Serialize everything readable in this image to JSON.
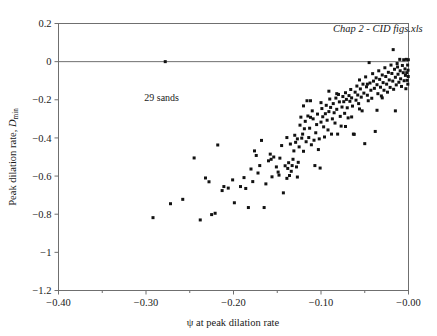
{
  "chart_data": {
    "type": "scatter",
    "title": "",
    "xlabel": "ψ at peak dilation rate",
    "ylabel": "Peak dilation rate, D_min",
    "ylabel_main": "Peak dilation rate, ",
    "ylabel_symbol": "D",
    "ylabel_subscript": "min",
    "xlim": [
      -0.4,
      0.0
    ],
    "ylim": [
      -1.2,
      0.2
    ],
    "xticks": [
      -0.4,
      -0.3,
      -0.2,
      -0.1,
      -0.0
    ],
    "xticklabels": [
      "−0.40",
      "−0.30",
      "−0.20",
      "−0.10",
      "−0.00"
    ],
    "xminorticks": [
      -0.35,
      -0.25,
      -0.15,
      -0.05
    ],
    "yticks": [
      0.2,
      0,
      -0.2,
      -0.4,
      -0.6,
      -0.8,
      -1,
      -1.2
    ],
    "yticklabels": [
      "0.2",
      "0",
      "−0.2",
      "−0.4",
      "−0.6",
      "−0.8",
      "−1",
      "−1.2"
    ],
    "grid": false,
    "legend": null,
    "reference_lines": [
      {
        "axis": "y",
        "value": 0,
        "color": "#6f6f6f"
      }
    ],
    "marker": {
      "shape": "square",
      "size": 3.0,
      "color": "#121212"
    },
    "annotations": [
      {
        "text": "Chap 2 - CID figs.xls",
        "x": -0.035,
        "y": 0.155,
        "style": "italic",
        "anchor": "middle"
      },
      {
        "text": "29 sands",
        "x": -0.302,
        "y": -0.205,
        "style": "plain",
        "anchor": "start"
      }
    ],
    "series": [
      {
        "name": "sand data",
        "points": [
          [
            -0.278,
            0.0
          ],
          [
            -0.292,
            -0.818
          ],
          [
            -0.272,
            -0.745
          ],
          [
            -0.258,
            -0.722
          ],
          [
            -0.245,
            -0.505
          ],
          [
            -0.238,
            -0.83
          ],
          [
            -0.232,
            -0.61
          ],
          [
            -0.228,
            -0.63
          ],
          [
            -0.225,
            -0.802
          ],
          [
            -0.221,
            -0.795
          ],
          [
            -0.218,
            -0.437
          ],
          [
            -0.213,
            -0.676
          ],
          [
            -0.211,
            -0.655
          ],
          [
            -0.206,
            -0.663
          ],
          [
            -0.201,
            -0.62
          ],
          [
            -0.199,
            -0.74
          ],
          [
            -0.192,
            -0.655
          ],
          [
            -0.188,
            -0.608
          ],
          [
            -0.186,
            -0.665
          ],
          [
            -0.183,
            -0.765
          ],
          [
            -0.18,
            -0.563
          ],
          [
            -0.178,
            -0.629
          ],
          [
            -0.176,
            -0.468
          ],
          [
            -0.174,
            -0.492
          ],
          [
            -0.172,
            -0.584
          ],
          [
            -0.17,
            -0.545
          ],
          [
            -0.168,
            -0.413
          ],
          [
            -0.165,
            -0.765
          ],
          [
            -0.163,
            -0.641
          ],
          [
            -0.16,
            -0.52
          ],
          [
            -0.158,
            -0.485
          ],
          [
            -0.156,
            -0.604
          ],
          [
            -0.154,
            -0.5
          ],
          [
            -0.151,
            -0.552
          ],
          [
            -0.149,
            -0.579
          ],
          [
            -0.147,
            -0.506
          ],
          [
            -0.145,
            -0.44
          ],
          [
            -0.143,
            -0.688
          ],
          [
            -0.141,
            -0.546
          ],
          [
            -0.139,
            -0.612
          ],
          [
            -0.138,
            -0.56
          ],
          [
            -0.137,
            -0.53
          ],
          [
            -0.136,
            -0.597
          ],
          [
            -0.135,
            -0.432
          ],
          [
            -0.134,
            -0.575
          ],
          [
            -0.133,
            -0.545
          ],
          [
            -0.132,
            -0.512
          ],
          [
            -0.131,
            -0.468
          ],
          [
            -0.13,
            -0.386
          ],
          [
            -0.129,
            -0.423
          ],
          [
            -0.128,
            -0.552
          ],
          [
            -0.127,
            -0.605
          ],
          [
            -0.126,
            -0.528
          ],
          [
            -0.125,
            -0.447
          ],
          [
            -0.124,
            -0.333
          ],
          [
            -0.123,
            -0.291
          ],
          [
            -0.122,
            -0.401
          ],
          [
            -0.121,
            -0.38
          ],
          [
            -0.12,
            -0.47
          ],
          [
            -0.119,
            -0.352
          ],
          [
            -0.118,
            -0.313
          ],
          [
            -0.117,
            -0.42
          ],
          [
            -0.116,
            -0.205
          ],
          [
            -0.115,
            -0.285
          ],
          [
            -0.114,
            -0.398
          ],
          [
            -0.113,
            -0.349
          ],
          [
            -0.112,
            -0.292
          ],
          [
            -0.111,
            -0.436
          ],
          [
            -0.11,
            -0.258
          ],
          [
            -0.109,
            -0.3
          ],
          [
            -0.108,
            -0.412
          ],
          [
            -0.107,
            -0.545
          ],
          [
            -0.106,
            -0.373
          ],
          [
            -0.105,
            -0.33
          ],
          [
            -0.104,
            -0.275
          ],
          [
            -0.103,
            -0.461
          ],
          [
            -0.102,
            -0.405
          ],
          [
            -0.101,
            -0.558
          ],
          [
            -0.1,
            -0.317
          ],
          [
            -0.099,
            -0.246
          ],
          [
            -0.098,
            -0.289
          ],
          [
            -0.097,
            -0.342
          ],
          [
            -0.096,
            -0.395
          ],
          [
            -0.095,
            -0.273
          ],
          [
            -0.094,
            -0.229
          ],
          [
            -0.093,
            -0.307
          ],
          [
            -0.092,
            -0.358
          ],
          [
            -0.091,
            -0.262
          ],
          [
            -0.09,
            -0.196
          ],
          [
            -0.089,
            -0.24
          ],
          [
            -0.088,
            -0.38
          ],
          [
            -0.087,
            -0.3
          ],
          [
            -0.086,
            -0.22
          ],
          [
            -0.085,
            -0.268
          ],
          [
            -0.084,
            -0.322
          ],
          [
            -0.083,
            -0.191
          ],
          [
            -0.082,
            -0.25
          ],
          [
            -0.081,
            -0.38
          ],
          [
            -0.08,
            -0.172
          ],
          [
            -0.079,
            -0.211
          ],
          [
            -0.078,
            -0.287
          ],
          [
            -0.077,
            -0.338
          ],
          [
            -0.076,
            -0.238
          ],
          [
            -0.075,
            -0.183
          ],
          [
            -0.074,
            -0.21
          ],
          [
            -0.073,
            -0.271
          ],
          [
            -0.072,
            -0.163
          ],
          [
            -0.071,
            -0.198
          ],
          [
            -0.07,
            -0.242
          ],
          [
            -0.069,
            -0.295
          ],
          [
            -0.068,
            -0.178
          ],
          [
            -0.067,
            -0.208
          ],
          [
            -0.066,
            -0.146
          ],
          [
            -0.065,
            -0.19
          ],
          [
            -0.064,
            -0.233
          ],
          [
            -0.063,
            -0.38
          ],
          [
            -0.062,
            -0.381
          ],
          [
            -0.061,
            -0.16
          ],
          [
            -0.06,
            -0.202
          ],
          [
            -0.059,
            -0.128
          ],
          [
            -0.058,
            -0.175
          ],
          [
            -0.057,
            -0.22
          ],
          [
            -0.056,
            -0.096
          ],
          [
            -0.055,
            -0.143
          ],
          [
            -0.054,
            -0.186
          ],
          [
            -0.053,
            -0.258
          ],
          [
            -0.052,
            -0.118
          ],
          [
            -0.051,
            -0.165
          ],
          [
            -0.05,
            -0.43
          ],
          [
            -0.049,
            -0.08
          ],
          [
            -0.048,
            -0.132
          ],
          [
            -0.047,
            -0.176
          ],
          [
            -0.046,
            -0.205
          ],
          [
            -0.045,
            -0.005
          ],
          [
            -0.044,
            -0.112
          ],
          [
            -0.043,
            -0.15
          ],
          [
            -0.042,
            -0.192
          ],
          [
            -0.041,
            -0.063
          ],
          [
            -0.04,
            -0.102
          ],
          [
            -0.039,
            -0.14
          ],
          [
            -0.038,
            -0.366
          ],
          [
            -0.037,
            -0.085
          ],
          [
            -0.036,
            -0.121
          ],
          [
            -0.035,
            -0.168
          ],
          [
            -0.034,
            -0.048
          ],
          [
            -0.033,
            -0.093
          ],
          [
            -0.032,
            -0.134
          ],
          [
            -0.031,
            -0.18
          ],
          [
            -0.03,
            -0.07
          ],
          [
            -0.029,
            -0.11
          ],
          [
            -0.028,
            -0.15
          ],
          [
            -0.027,
            -0.032
          ],
          [
            -0.026,
            -0.078
          ],
          [
            -0.025,
            -0.118
          ],
          [
            -0.024,
            -0.16
          ],
          [
            -0.023,
            -0.056
          ],
          [
            -0.022,
            -0.096
          ],
          [
            -0.021,
            -0.135
          ],
          [
            -0.02,
            -0.018
          ],
          [
            -0.019,
            -0.062
          ],
          [
            -0.018,
            -0.102
          ],
          [
            -0.0175,
            0.063
          ],
          [
            -0.017,
            -0.145
          ],
          [
            -0.016,
            -0.04
          ],
          [
            -0.015,
            -0.082
          ],
          [
            -0.014,
            -0.122
          ],
          [
            -0.013,
            -0.01
          ],
          [
            -0.0125,
            -0.028
          ],
          [
            -0.012,
            -0.066
          ],
          [
            -0.011,
            -0.108
          ],
          [
            -0.01,
            0.012
          ],
          [
            -0.0095,
            -0.048
          ],
          [
            -0.009,
            -0.09
          ],
          [
            -0.008,
            -0.13
          ],
          [
            -0.007,
            -0.02
          ],
          [
            -0.006,
            -0.058
          ],
          [
            -0.0055,
            0.01
          ],
          [
            -0.005,
            -0.1
          ],
          [
            -0.004,
            -0.038
          ],
          [
            -0.0035,
            -0.072
          ],
          [
            -0.003,
            -0.142
          ],
          [
            -0.0025,
            0.012
          ],
          [
            -0.002,
            -0.058
          ],
          [
            -0.0015,
            -0.098
          ],
          [
            -0.001,
            -0.018
          ],
          [
            -0.0008,
            -0.118
          ],
          [
            -0.0005,
            -0.045
          ],
          [
            -0.0003,
            -0.078
          ],
          [
            -0.0002,
            0.01
          ],
          [
            -0.015,
            -0.258
          ],
          [
            -0.036,
            -0.255
          ],
          [
            -0.03,
            -0.19
          ],
          [
            -0.047,
            -0.118
          ],
          [
            -0.056,
            -0.248
          ],
          [
            -0.065,
            -0.29
          ],
          [
            -0.072,
            -0.34
          ],
          [
            -0.082,
            -0.168
          ],
          [
            -0.091,
            -0.155
          ],
          [
            -0.1,
            -0.215
          ],
          [
            -0.112,
            -0.205
          ],
          [
            -0.12,
            -0.232
          ],
          [
            -0.127,
            -0.405
          ],
          [
            -0.139,
            -0.398
          ],
          [
            -0.148,
            -0.595
          ],
          [
            -0.157,
            -0.512
          ]
        ]
      }
    ]
  }
}
